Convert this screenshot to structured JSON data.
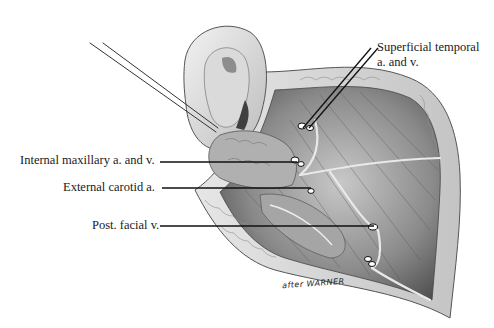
{
  "figure": {
    "type": "anatomical illustration",
    "labels": [
      {
        "id": "superficial-temporal",
        "line1": "Superficial temporal",
        "line2": "a. and v."
      },
      {
        "id": "internal-maxillary",
        "text": "Internal maxillary a. and v."
      },
      {
        "id": "external-carotid",
        "text": "External carotid a."
      },
      {
        "id": "post-facial",
        "text": "Post. facial v."
      }
    ],
    "signature": "after WARNER",
    "colors": {
      "background": "#ffffff",
      "ink": "#1a1a1a",
      "tissue_dark": "#555555",
      "tissue_light": "#cfcfcf"
    }
  }
}
